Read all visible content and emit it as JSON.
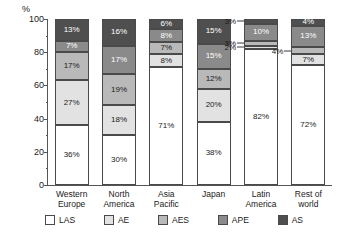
{
  "chart_data": {
    "type": "bar",
    "title": "",
    "xlabel": "",
    "ylabel": "%",
    "ylim": [
      0,
      100
    ],
    "ytick_labels": [
      "0",
      "20",
      "40",
      "60",
      "80",
      "100"
    ],
    "ytick_values": [
      0,
      20,
      40,
      60,
      80,
      100
    ],
    "minor_ticks": [
      10,
      30,
      50,
      70,
      90
    ],
    "grid": false,
    "stacked": true,
    "legend_position": "bottom",
    "categories": [
      "Western Europe",
      "North America",
      "Asia Pacific",
      "Japan",
      "Latin America",
      "Rest of world"
    ],
    "category_lines": [
      [
        "Western",
        "Europe"
      ],
      [
        "North",
        "America"
      ],
      [
        "Asia",
        "Pacific"
      ],
      [
        "Japan",
        ""
      ],
      [
        "Latin",
        "America"
      ],
      [
        "Rest of",
        "world"
      ]
    ],
    "series": [
      {
        "name": "LAS",
        "color": "#ffffff",
        "values": [
          36,
          30,
          71,
          38,
          82,
          72
        ]
      },
      {
        "name": "AE",
        "color": "#e2e2e2",
        "values": [
          27,
          18,
          8,
          20,
          2,
          7
        ]
      },
      {
        "name": "AES",
        "color": "#b9b9b9",
        "values": [
          17,
          19,
          7,
          12,
          3,
          4
        ]
      },
      {
        "name": "APE",
        "color": "#8a8a8a",
        "values": [
          7,
          17,
          8,
          15,
          10,
          13
        ]
      },
      {
        "name": "AS",
        "color": "#4f4f4f",
        "values": [
          13,
          16,
          6,
          15,
          3,
          4
        ]
      }
    ],
    "data_labels": [
      [
        "36%",
        "27%",
        "17%",
        "7%",
        "13%"
      ],
      [
        "30%",
        "18%",
        "19%",
        "17%",
        "16%"
      ],
      [
        "71%",
        "8%",
        "7%",
        "8%",
        "6%"
      ],
      [
        "38%",
        "20%",
        "12%",
        "15%",
        "15%"
      ],
      [
        "82%",
        "2%",
        "3%",
        "10%",
        "3%"
      ],
      [
        "72%",
        "7%",
        "4%",
        "13%",
        "4%"
      ]
    ],
    "external_labels": [
      {
        "category": "Latin America",
        "series": "AE",
        "text": "2%"
      },
      {
        "category": "Latin America",
        "series": "AES",
        "text": "3%"
      },
      {
        "category": "Latin America",
        "series": "AS",
        "text": "3%"
      },
      {
        "category": "Rest of world",
        "series": "AES",
        "text": "4%"
      }
    ]
  },
  "legend": {
    "items": [
      {
        "label": "LAS",
        "color": "#ffffff"
      },
      {
        "label": "AE",
        "color": "#e2e2e2"
      },
      {
        "label": "AES",
        "color": "#b9b9b9"
      },
      {
        "label": "APE",
        "color": "#8a8a8a"
      },
      {
        "label": "AS",
        "color": "#4f4f4f"
      }
    ]
  }
}
